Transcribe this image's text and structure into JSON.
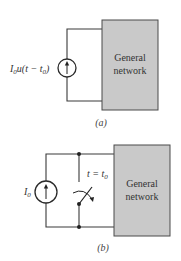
{
  "figure_a": {
    "source_label_main": "I",
    "source_label_sub0": "0",
    "source_label_rest": "u(t − t",
    "source_label_sub1": "0",
    "source_label_end": ")",
    "box_line1": "General",
    "box_line2": "network",
    "caption": "(a)"
  },
  "figure_b": {
    "source_label_main": "I",
    "source_label_sub": "0",
    "switch_label_main": "t = t",
    "switch_label_sub": "0",
    "box_line1": "General",
    "box_line2": "network",
    "caption": "(b)"
  },
  "colors": {
    "box_fill": "#c9c9c9",
    "wire": "#3a3a3a"
  }
}
